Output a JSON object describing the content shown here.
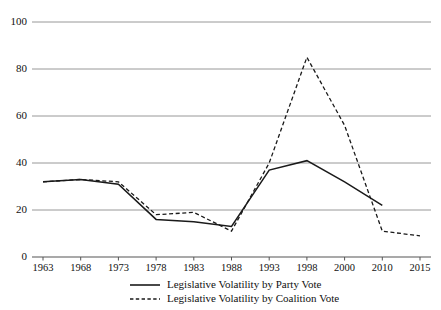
{
  "chart_data": {
    "type": "line",
    "title": "",
    "xlabel": "",
    "ylabel": "",
    "ylim": [
      0,
      100
    ],
    "yticks": [
      0,
      20,
      40,
      60,
      80,
      100
    ],
    "grid": true,
    "legend_position": "bottom",
    "categories": [
      "1963",
      "1968",
      "1973",
      "1978",
      "1983",
      "1988",
      "1993",
      "1998",
      "2000",
      "2010",
      "2015"
    ],
    "series": [
      {
        "name": "Legislative Volatility by Party Vote",
        "style": "solid",
        "values": [
          32,
          33,
          31,
          16,
          15,
          13,
          37,
          41,
          32,
          22,
          null
        ]
      },
      {
        "name": "Legislative Volatility by Coalition Vote",
        "style": "dashed",
        "values": [
          32,
          33,
          32,
          18,
          19,
          11,
          40,
          85,
          56,
          11,
          9
        ]
      }
    ]
  },
  "axis": {
    "y_tick_labels": [
      "0",
      "20",
      "40",
      "60",
      "80",
      "100"
    ],
    "x_tick_labels": [
      "1963",
      "1968",
      "1973",
      "1978",
      "1983",
      "1988",
      "1993",
      "1998",
      "2000",
      "2010",
      "2015"
    ]
  },
  "legend": {
    "entries": [
      {
        "label": "Legislative Volatility by Party Vote",
        "style": "solid"
      },
      {
        "label": "Legislative Volatility by Coalition Vote",
        "style": "dashed"
      }
    ]
  },
  "colors": {
    "line": "#1a1a1a",
    "grid": "#8c8c8c",
    "axis": "#555555",
    "background": "#ffffff"
  }
}
